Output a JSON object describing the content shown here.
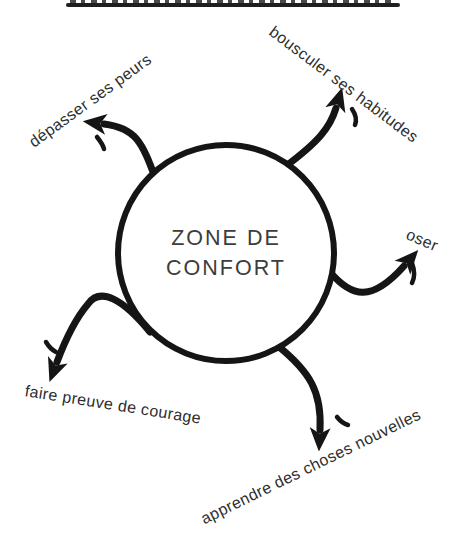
{
  "page": {
    "background": "#ffffff",
    "ink_color": "#151515",
    "center_text_color": "#3d3d3d",
    "label_text_color": "#2e2e2e",
    "truncated_title": {
      "visible": true,
      "note": "underlined heading cut off at top edge"
    }
  },
  "diagram": {
    "center": {
      "line1": "ZONE DE",
      "line2": "CONFORT"
    },
    "labels": [
      {
        "id": "depasser-ses-peurs",
        "text": "dépasser ses peurs",
        "rotation_deg": -36
      },
      {
        "id": "bousculer-ses-habitudes",
        "text": "bousculer ses habitudes",
        "rotation_deg": 37
      },
      {
        "id": "oser",
        "text": "oser",
        "rotation_deg": 23
      },
      {
        "id": "apprendre-des-choses-nouvelles",
        "text": "apprendre des choses nouvelles",
        "rotation_deg": -26
      },
      {
        "id": "faire-preuve-de-courage",
        "text": "faire preuve de courage",
        "rotation_deg": 9
      }
    ]
  }
}
